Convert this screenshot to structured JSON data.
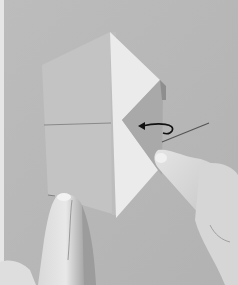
{
  "image": {
    "description": "Grayscale instructional photo of an origami fold: a square paper partially folded with a white triangular flap on the right, a curved arrow pointing left indicating a fold-back, and two hands holding the paper.",
    "alt": "Origami folding step photo with curved arrow",
    "colors": {
      "background": "#b9b9b9",
      "border_left": "#e6e6e6",
      "paper_front": "#c3c3c3",
      "paper_flap_white": "#ebebeb",
      "paper_flap_shaded": "#a9a9a9",
      "crease_line": "#7a7a7a",
      "arrow": "#111111",
      "skin_light": "#e2e2e2",
      "skin_shadow": "#9a9a9a"
    },
    "annotations": {
      "arrow": "curved-arrow-left",
      "leader_line": "pointer-line"
    }
  }
}
